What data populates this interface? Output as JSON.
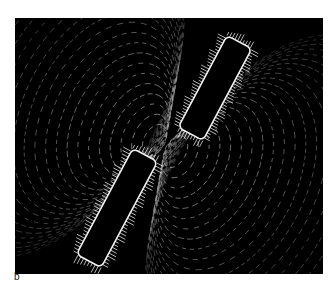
{
  "figure": {
    "panel_label": "b",
    "colors": {
      "background": "#000000",
      "filings": "#e6e6e6",
      "page": "#ffffff"
    }
  }
}
